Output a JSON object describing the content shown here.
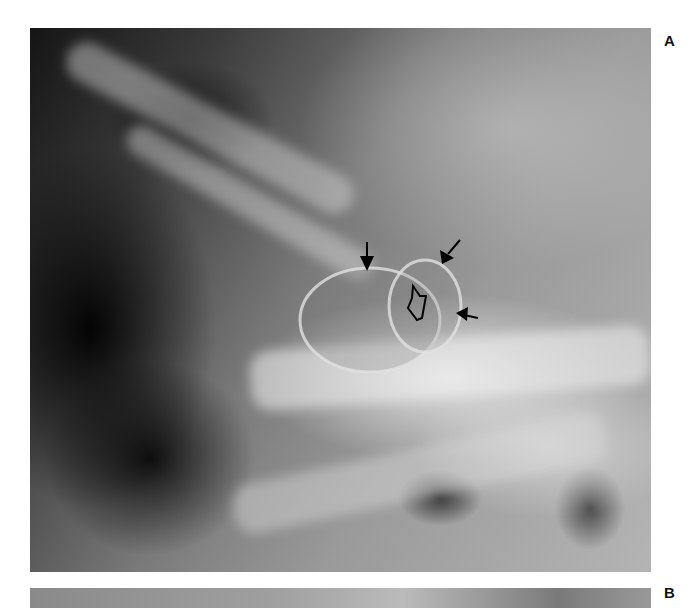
{
  "figure": {
    "panels": [
      {
        "label": "A",
        "type": "radiograph",
        "description": "Lateral skull radiograph showing an enlarged, rounded sella/lesion outline",
        "annotations": {
          "solid_arrows": 3,
          "open_arrow": 1
        }
      },
      {
        "label": "B",
        "type": "radiograph",
        "description": "Second panel, cropped at bottom edge"
      }
    ]
  },
  "colors": {
    "background": "#ffffff",
    "label": "#111111",
    "arrow": "#000000"
  }
}
